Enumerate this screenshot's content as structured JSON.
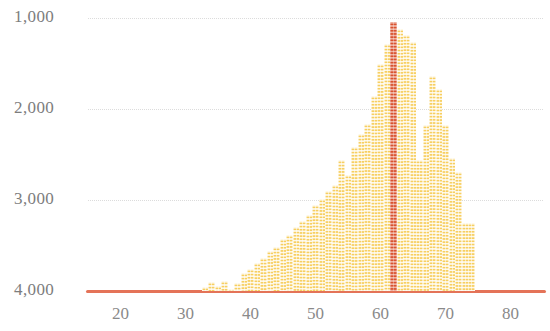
{
  "chart_data": {
    "type": "bar",
    "title": "",
    "subtitle": "",
    "xlabel": "",
    "ylabel": "",
    "grid": true,
    "legend": null,
    "y_axis": {
      "inverted": true,
      "ticks": [
        1000,
        2000,
        3000,
        4000
      ],
      "tick_labels": [
        "1,000",
        "2,000",
        "3,000",
        "4,000"
      ],
      "ylim": [
        4150,
        700
      ]
    },
    "x_axis": {
      "ticks": [
        20,
        30,
        40,
        50,
        60,
        70,
        80
      ],
      "tick_labels": [
        "20",
        "30",
        "40",
        "50",
        "60",
        "70",
        "80"
      ],
      "xlim": [
        15,
        85
      ]
    },
    "highlight": {
      "x": 62,
      "value": 1040,
      "color": "#d9522f"
    },
    "bar_color": "#f7cf61",
    "baseline_color": "#e2674a",
    "x": [
      33,
      34,
      35,
      36,
      37,
      38,
      39,
      40,
      41,
      42,
      43,
      44,
      45,
      46,
      47,
      48,
      49,
      50,
      51,
      52,
      53,
      54,
      55,
      56,
      57,
      58,
      59,
      60,
      61,
      62,
      63,
      64,
      65,
      66,
      67,
      68,
      69,
      70,
      71,
      72,
      73,
      74
    ],
    "values": [
      3960,
      3905,
      3945,
      3890,
      3975,
      3915,
      3805,
      3760,
      3690,
      3640,
      3555,
      3520,
      3430,
      3380,
      3300,
      3235,
      3160,
      3060,
      2985,
      2905,
      2830,
      2560,
      2720,
      2420,
      2270,
      2160,
      1860,
      1500,
      1290,
      1040,
      1120,
      1190,
      1260,
      2560,
      2180,
      1640,
      1780,
      2180,
      2540,
      2690,
      3250,
      3250
    ]
  }
}
